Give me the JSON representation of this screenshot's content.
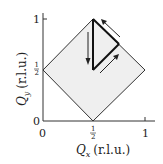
{
  "diagram": {
    "type": "brillouin-zone",
    "x_axis": {
      "label_symbol": "Q",
      "label_sub": "x",
      "label_units": "(r.l.u.)",
      "ticks": [
        "0",
        "1"
      ],
      "half_num": "1",
      "half_den": "2"
    },
    "y_axis": {
      "label_symbol": "Q",
      "label_sub": "y",
      "label_units": "(r.l.u.)",
      "ticks": [
        "0",
        "1"
      ],
      "half_num": "1",
      "half_den": "2"
    },
    "colors": {
      "zone_fill": "#efefef",
      "line": "#222222"
    },
    "zone_vertices": [
      [
        0,
        0.5
      ],
      [
        0.5,
        1
      ],
      [
        1,
        0.5
      ],
      [
        0.5,
        0
      ]
    ],
    "path": [
      [
        0.5,
        1
      ],
      [
        0.5,
        0.5
      ],
      [
        0.75,
        0.75
      ],
      [
        0.5,
        1
      ]
    ],
    "arrows": [
      "down along x=1/2",
      "up-right along diagonal",
      "up-left along zone edge"
    ]
  }
}
